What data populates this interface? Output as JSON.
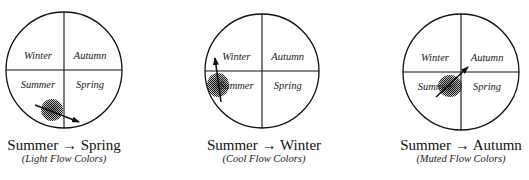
{
  "diagrams": [
    {
      "cx": 64,
      "cy": 70,
      "r": 58,
      "quadrants": {
        "top_left": "Winter",
        "top_right": "Autumn",
        "bottom_left": "Summer",
        "bottom_right": "Spring"
      },
      "blob": {
        "cx": 52,
        "cy": 110,
        "rx": 11,
        "ry": 11
      },
      "arrow": {
        "x1": 35,
        "y1": 105,
        "x2": 79,
        "y2": 122
      },
      "title": "Summer → Spring",
      "subtitle": "(Light Flow Colors)",
      "title_x": 64
    },
    {
      "cx": 262,
      "cy": 71,
      "r": 57,
      "quadrants": {
        "top_left": "Winter",
        "top_right": "Autumn",
        "bottom_left": "Summer",
        "bottom_right": "Spring"
      },
      "blob": {
        "cx": 218,
        "cy": 85,
        "rx": 11,
        "ry": 12
      },
      "arrow": {
        "x1": 221,
        "y1": 102,
        "x2": 215,
        "y2": 58
      },
      "title": "Summer → Winter",
      "subtitle": "(Cool Flow Colors)",
      "title_x": 264
    },
    {
      "cx": 461,
      "cy": 72,
      "r": 58,
      "quadrants": {
        "top_left": "Winter",
        "top_right": "Autumn",
        "bottom_left": "Summer",
        "bottom_right": "Spring"
      },
      "blob": {
        "cx": 450,
        "cy": 86,
        "rx": 12,
        "ry": 11
      },
      "arrow": {
        "x1": 436,
        "y1": 97,
        "x2": 468,
        "y2": 67
      },
      "title": "Summer → Autumn",
      "subtitle": "(Muted Flow Colors)",
      "title_x": 461
    }
  ],
  "colors": {
    "stroke": "#111111",
    "blob": "#555555"
  }
}
